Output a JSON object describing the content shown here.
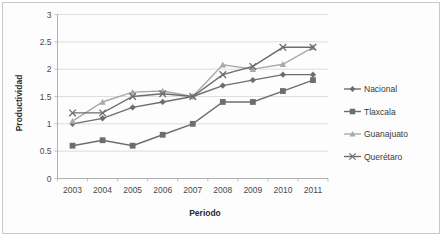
{
  "chart_data": {
    "type": "line",
    "title": "",
    "xlabel": "Periodo",
    "ylabel": "Productividad",
    "categories": [
      "2003",
      "2004",
      "2005",
      "2006",
      "2007",
      "2008",
      "2009",
      "2010",
      "2011"
    ],
    "ylim": [
      0,
      3
    ],
    "yticks": [
      "0",
      "0.5",
      "1",
      "1.5",
      "2",
      "2.5",
      "3"
    ],
    "ytick_values": [
      0,
      0.5,
      1,
      1.5,
      2,
      2.5,
      3
    ],
    "grid": true,
    "legend_position": "right",
    "series": [
      {
        "name": "Nacional",
        "marker": "diamond",
        "color": "#6d6d6d",
        "values": [
          1.0,
          1.1,
          1.3,
          1.4,
          1.5,
          1.7,
          1.8,
          1.9,
          1.9
        ]
      },
      {
        "name": "Tlaxcala",
        "marker": "square",
        "color": "#6d6d6d",
        "values": [
          0.6,
          0.7,
          0.6,
          0.8,
          1.0,
          1.4,
          1.4,
          1.6,
          1.8
        ]
      },
      {
        "name": "Guanajuato",
        "marker": "triangle",
        "color": "#a9a9a9",
        "values": [
          1.05,
          1.4,
          1.58,
          1.6,
          1.5,
          2.08,
          2.0,
          2.09,
          2.4
        ]
      },
      {
        "name": "Querétaro",
        "marker": "cross",
        "color": "#6d6d6d",
        "values": [
          1.2,
          1.2,
          1.5,
          1.55,
          1.5,
          1.9,
          2.05,
          2.4,
          2.4
        ]
      }
    ]
  },
  "legend": {
    "items": [
      {
        "label": "Nacional"
      },
      {
        "label": "Tlaxcala"
      },
      {
        "label": "Guanajuato"
      },
      {
        "label": "Querétaro"
      }
    ]
  },
  "axis": {
    "y_title": "Productividad",
    "x_title": "Periodo"
  },
  "colors": {
    "dark_series": "#6d6d6d",
    "light_series": "#a9a9a9",
    "gridline": "#d0d0d0",
    "axis": "#a8a8a8",
    "text": "#4a4a4a",
    "frame": "#c9c9c9",
    "background": "#fdfdfd"
  }
}
